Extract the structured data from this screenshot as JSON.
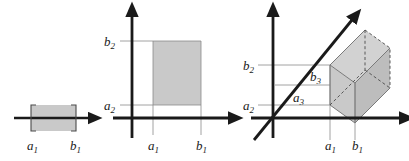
{
  "figure": {
    "background_color": "#ffffff",
    "axis_color": "#1a1a1a",
    "guide_line_color": "#8a8a8a",
    "fill_color": "#c9c9c9",
    "fill_color_dark": "#b5b5b5",
    "fill_color_light": "#d2d2d2",
    "dash_color": "#4a4a4a"
  },
  "panels": [
    {
      "id": "panel-1d",
      "name": "one-dimensional-interval",
      "dimension": 1,
      "description": "A shaded interval on a single horizontal number line with bracket end marks",
      "labels": {
        "a1": "a",
        "a1_sub": "1",
        "b1": "b",
        "b1_sub": "1"
      }
    },
    {
      "id": "panel-2d",
      "name": "two-dimensional-rectangle",
      "dimension": 2,
      "description": "A shaded rectangle in the plane bounded by a1, b1 horizontally and a2, b2 vertically",
      "labels": {
        "a1": "a",
        "a1_sub": "1",
        "b1": "b",
        "b1_sub": "1",
        "a2": "a",
        "a2_sub": "2",
        "b2": "b",
        "b2_sub": "2"
      }
    },
    {
      "id": "panel-3d",
      "name": "three-dimensional-box",
      "dimension": 3,
      "description": "A shaded rectangular box in three-space with a diagonal third axis; hidden edges drawn dashed",
      "labels": {
        "a1": "a",
        "a1_sub": "1",
        "b1": "b",
        "b1_sub": "1",
        "a2": "a",
        "a2_sub": "2",
        "b2": "b",
        "b2_sub": "2",
        "a3": "a",
        "a3_sub": "3",
        "b3": "b",
        "b3_sub": "3"
      }
    }
  ]
}
